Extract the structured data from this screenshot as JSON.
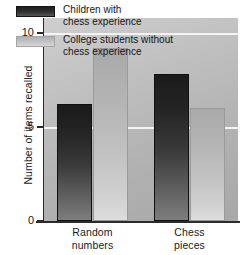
{
  "chart_data": {
    "type": "bar",
    "title": "",
    "xlabel": "",
    "ylabel": "Number of items recalled",
    "categories": [
      "Random\nnumbers",
      "Chess\npieces"
    ],
    "category_lines": [
      [
        "Random",
        "numbers"
      ],
      [
        "Chess",
        "pieces"
      ]
    ],
    "series": [
      {
        "name": "Children with chess experience",
        "name_lines": [
          "Children with",
          "chess experience"
        ],
        "color": "#232323",
        "values": [
          6.2,
          7.8
        ]
      },
      {
        "name": "College students without chess experience",
        "name_lines": [
          "College students without",
          "chess experience"
        ],
        "color": "#c2c2c2",
        "values": [
          9.2,
          6.0
        ]
      }
    ],
    "ylim": [
      0,
      10.8
    ],
    "yticks": [
      0,
      5,
      10
    ],
    "ytick_labels": [
      "0",
      "5",
      "10"
    ],
    "gridlines": [
      5,
      10
    ],
    "grid": true,
    "legend_position": "top-left-inside",
    "plot_background": "#b8b8b8",
    "gridline_color": "#f4f4f4",
    "axis_color": "#2b2b2b"
  }
}
